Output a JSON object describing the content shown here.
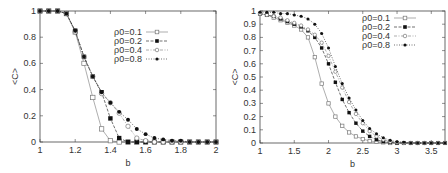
{
  "chart_data": [
    {
      "type": "line",
      "panel": "left",
      "title": "",
      "xlabel": "b",
      "ylabel": "<C>",
      "xlim": [
        1,
        2
      ],
      "ylim": [
        0,
        1
      ],
      "xticks": [
        "1",
        "1.2",
        "1.4",
        "1.6",
        "1.8",
        "2"
      ],
      "yticks": [
        "0",
        "0.2",
        "0.4",
        "0.6",
        "0.8",
        "1"
      ],
      "grid": false,
      "legend_position": "upper right",
      "x": [
        1.0,
        1.05,
        1.1,
        1.15,
        1.2,
        1.25,
        1.3,
        1.35,
        1.4,
        1.45,
        1.5,
        1.55,
        1.6,
        1.65,
        1.7,
        1.75,
        1.8,
        1.85,
        1.9,
        1.95,
        2.0
      ],
      "series": [
        {
          "name": "ρ0=0.1",
          "marker": "open-square",
          "dash": "solid",
          "values": [
            1.0,
            1.0,
            1.0,
            0.98,
            0.84,
            0.6,
            0.34,
            0.1,
            0.01,
            0.0,
            0.0,
            0.0,
            0.0,
            0.0,
            0.0,
            0.0,
            0.0,
            0.0,
            0.0,
            0.0,
            0.0
          ]
        },
        {
          "name": "ρ0=0.2",
          "marker": "filled-square",
          "dash": "dash",
          "values": [
            1.0,
            1.0,
            1.0,
            0.98,
            0.85,
            0.65,
            0.5,
            0.38,
            0.18,
            0.03,
            0.0,
            0.0,
            0.0,
            0.0,
            0.0,
            0.0,
            0.0,
            0.0,
            0.0,
            0.0,
            0.0
          ]
        },
        {
          "name": "ρ0=0.4",
          "marker": "open-circle",
          "dash": "dashdot",
          "values": [
            1.0,
            1.0,
            1.0,
            0.98,
            0.84,
            0.65,
            0.5,
            0.37,
            0.3,
            0.22,
            0.12,
            0.03,
            0.01,
            0.0,
            0.0,
            0.0,
            0.0,
            0.0,
            0.0,
            0.0,
            0.0
          ]
        },
        {
          "name": "ρ0=0.8",
          "marker": "filled-circle",
          "dash": "dot",
          "values": [
            1.0,
            1.0,
            1.0,
            0.98,
            0.85,
            0.65,
            0.5,
            0.38,
            0.3,
            0.23,
            0.17,
            0.1,
            0.06,
            0.03,
            0.02,
            0.01,
            0.01,
            0.0,
            0.0,
            0.0,
            0.0
          ]
        }
      ]
    },
    {
      "type": "line",
      "panel": "right",
      "title": "",
      "xlabel": "b",
      "ylabel": "<C>",
      "xlim": [
        1,
        3.7
      ],
      "ylim": [
        0,
        1
      ],
      "xticks": [
        "1",
        "1.5",
        "2",
        "2.5",
        "3",
        "3.5"
      ],
      "yticks": [
        "0",
        "0.1",
        "0.2",
        "0.3",
        "0.4",
        "0.5",
        "0.6",
        "0.7",
        "0.8",
        "0.9",
        "1"
      ],
      "grid": false,
      "legend_position": "upper right",
      "x": [
        1.0,
        1.1,
        1.2,
        1.3,
        1.4,
        1.5,
        1.6,
        1.7,
        1.8,
        1.9,
        2.0,
        2.1,
        2.2,
        2.3,
        2.4,
        2.5,
        2.6,
        2.7,
        2.8,
        2.9,
        3.0,
        3.1,
        3.2,
        3.3,
        3.4,
        3.5,
        3.6,
        3.7
      ],
      "series": [
        {
          "name": "ρ0=0.1",
          "marker": "open-square",
          "dash": "solid",
          "values": [
            0.98,
            0.97,
            0.95,
            0.93,
            0.91,
            0.89,
            0.86,
            0.8,
            0.65,
            0.45,
            0.3,
            0.2,
            0.13,
            0.08,
            0.05,
            0.03,
            0.015,
            0.01,
            0.005,
            0.0,
            0.0,
            0.0,
            0.0,
            0.0,
            0.0,
            0.0,
            0.0,
            0.0
          ]
        },
        {
          "name": "ρ0=0.2",
          "marker": "filled-square",
          "dash": "dash",
          "values": [
            0.98,
            0.97,
            0.96,
            0.94,
            0.92,
            0.9,
            0.88,
            0.85,
            0.8,
            0.72,
            0.6,
            0.46,
            0.33,
            0.23,
            0.15,
            0.09,
            0.05,
            0.025,
            0.01,
            0.005,
            0.0,
            0.0,
            0.0,
            0.0,
            0.0,
            0.0,
            0.0,
            0.0
          ]
        },
        {
          "name": "ρ0=0.4",
          "marker": "open-circle",
          "dash": "dashdot",
          "values": [
            0.98,
            0.97,
            0.96,
            0.95,
            0.93,
            0.91,
            0.89,
            0.86,
            0.82,
            0.76,
            0.66,
            0.54,
            0.42,
            0.31,
            0.22,
            0.15,
            0.09,
            0.05,
            0.025,
            0.01,
            0.005,
            0.0,
            0.0,
            0.0,
            0.0,
            0.0,
            0.0,
            0.0
          ]
        },
        {
          "name": "ρ0=0.8",
          "marker": "filled-circle",
          "dash": "dot",
          "values": [
            0.99,
            0.99,
            0.99,
            0.98,
            0.98,
            0.97,
            0.96,
            0.94,
            0.9,
            0.83,
            0.72,
            0.58,
            0.45,
            0.34,
            0.25,
            0.17,
            0.11,
            0.07,
            0.04,
            0.02,
            0.01,
            0.005,
            0.0,
            0.0,
            0.0,
            0.0,
            0.0,
            0.0
          ]
        }
      ]
    }
  ],
  "colors": {
    "axis": "#444444",
    "series_open": "#777777",
    "series_filled": "#111111"
  }
}
